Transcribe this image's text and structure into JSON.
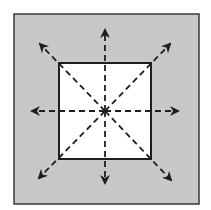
{
  "diagram": {
    "colors": {
      "page_background": "#ffffff",
      "outer_fill": "#c8c8c8",
      "outer_stroke": "#3a3a3a",
      "inner_fill": "#ffffff",
      "inner_stroke": "#1e1e1e",
      "arrow_color": "#1e1e1e"
    },
    "outer_box": {
      "x": 14,
      "y": 14,
      "width": 185,
      "height": 190
    },
    "inner_square": {
      "x": 59,
      "y": 63,
      "width": 92,
      "height": 96
    },
    "center": {
      "x": 105,
      "y": 111
    },
    "arrows": [
      {
        "direction": "up",
        "tip": [
          105,
          30
        ]
      },
      {
        "direction": "down",
        "tip": [
          105,
          183
        ]
      },
      {
        "direction": "left",
        "tip": [
          32,
          111
        ]
      },
      {
        "direction": "right",
        "tip": [
          178,
          111
        ]
      },
      {
        "direction": "up-left",
        "tip": [
          40,
          44
        ]
      },
      {
        "direction": "up-right",
        "tip": [
          170,
          44
        ]
      },
      {
        "direction": "down-left",
        "tip": [
          39,
          178
        ]
      },
      {
        "direction": "down-right",
        "tip": [
          171,
          180
        ]
      }
    ]
  }
}
